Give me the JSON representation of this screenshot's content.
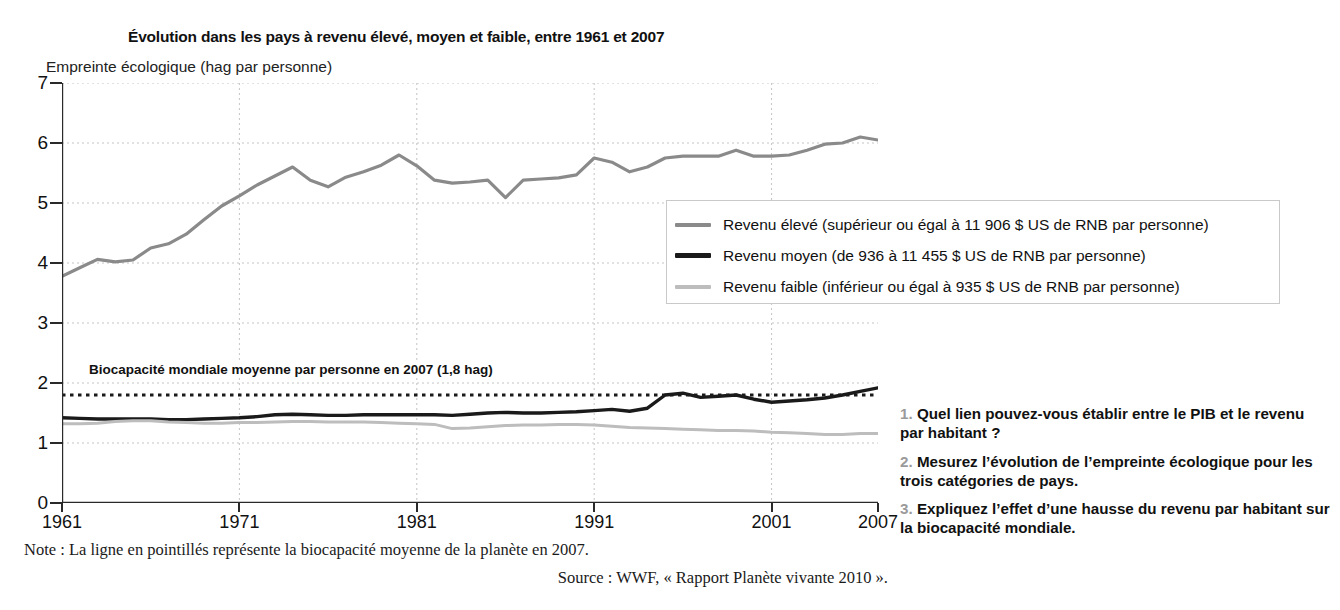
{
  "chart_data": {
    "type": "line",
    "title": "Évolution dans les pays à revenu élevé, moyen et faible, entre 1961 et 2007",
    "ylabel": "Empreinte écologique (hag par personne)",
    "xlabel": "",
    "ylim": [
      0,
      7
    ],
    "xlim": [
      1961,
      2007
    ],
    "yticks": [
      "0",
      "1",
      "2",
      "3",
      "4",
      "5",
      "6",
      "7"
    ],
    "xticks": [
      "1961",
      "1971",
      "1981",
      "1991",
      "2001",
      "2007"
    ],
    "grid": true,
    "legend_position": "upper right",
    "annotation": {
      "text": "Biocapacité mondiale moyenne par personne en 2007 (1,8 hag)",
      "value": 1.8,
      "style": "dotted-horizontal-line"
    },
    "x": [
      1961,
      1962,
      1963,
      1964,
      1965,
      1966,
      1967,
      1968,
      1969,
      1970,
      1971,
      1972,
      1973,
      1974,
      1975,
      1976,
      1977,
      1978,
      1979,
      1980,
      1981,
      1982,
      1983,
      1984,
      1985,
      1986,
      1987,
      1988,
      1989,
      1990,
      1991,
      1992,
      1993,
      1994,
      1995,
      1996,
      1997,
      1998,
      1999,
      2000,
      2001,
      2002,
      2003,
      2004,
      2005,
      2006,
      2007
    ],
    "series": [
      {
        "name": "Revenu élevé (supérieur ou égal à 11 906 $ US de RNB par personne)",
        "color": "#8a8a8a",
        "values": [
          3.78,
          3.92,
          4.06,
          4.02,
          4.05,
          4.25,
          4.32,
          4.48,
          4.72,
          4.95,
          5.12,
          5.3,
          5.45,
          5.6,
          5.38,
          5.27,
          5.43,
          5.52,
          5.63,
          5.8,
          5.62,
          5.38,
          5.33,
          5.35,
          5.38,
          5.09,
          5.38,
          5.4,
          5.42,
          5.47,
          5.75,
          5.68,
          5.52,
          5.6,
          5.75,
          5.78,
          5.78,
          5.78,
          5.88,
          5.78,
          5.78,
          5.8,
          5.88,
          5.98,
          6.0,
          6.1,
          6.05
        ]
      },
      {
        "name": "Revenu moyen (de 936 à 11 455 $ US de RNB par personne)",
        "color": "#1a1a1a",
        "values": [
          1.42,
          1.41,
          1.4,
          1.4,
          1.4,
          1.4,
          1.39,
          1.39,
          1.4,
          1.41,
          1.42,
          1.44,
          1.47,
          1.48,
          1.47,
          1.46,
          1.46,
          1.47,
          1.47,
          1.47,
          1.47,
          1.47,
          1.46,
          1.48,
          1.5,
          1.51,
          1.5,
          1.5,
          1.51,
          1.52,
          1.54,
          1.56,
          1.53,
          1.58,
          1.8,
          1.83,
          1.76,
          1.78,
          1.8,
          1.73,
          1.68,
          1.7,
          1.72,
          1.75,
          1.8,
          1.86,
          1.92
        ]
      },
      {
        "name": "Revenu faible (inférieur ou égal à 935 $ US de RNB par personne)",
        "color": "#bdbdbd",
        "values": [
          1.32,
          1.32,
          1.33,
          1.36,
          1.37,
          1.37,
          1.35,
          1.34,
          1.33,
          1.33,
          1.34,
          1.34,
          1.35,
          1.36,
          1.36,
          1.35,
          1.35,
          1.35,
          1.34,
          1.33,
          1.32,
          1.31,
          1.24,
          1.25,
          1.27,
          1.29,
          1.3,
          1.3,
          1.31,
          1.31,
          1.3,
          1.28,
          1.26,
          1.25,
          1.24,
          1.23,
          1.22,
          1.21,
          1.21,
          1.2,
          1.18,
          1.17,
          1.16,
          1.14,
          1.14,
          1.16,
          1.16
        ]
      }
    ]
  },
  "legend": {
    "items": [
      {
        "label": "Revenu élevé (supérieur ou égal à 11 906 $ US de RNB par personne)",
        "color": "#8a8a8a"
      },
      {
        "label": "Revenu moyen (de 936 à 11 455 $ US de RNB par personne)",
        "color": "#1a1a1a"
      },
      {
        "label": "Revenu faible (inférieur ou égal à 935 $ US de RNB par personne)",
        "color": "#bdbdbd"
      }
    ]
  },
  "footnotes": {
    "note": "Note : La ligne en pointillés représente la biocapacité moyenne de la planète en 2007.",
    "source": "Source : WWF, « Rapport Planète vivante 2010 »."
  },
  "questions": [
    {
      "number": "1.",
      "text": "Quel lien pouvez-vous établir entre le PIB et le revenu par habitant ?"
    },
    {
      "number": "2.",
      "text": "Mesurez l’évolution de l’empreinte écologique pour les trois catégories de pays."
    },
    {
      "number": "3.",
      "text": "Expliquez l’effet d’une hausse du revenu par habitant sur la biocapacité mondiale."
    }
  ]
}
